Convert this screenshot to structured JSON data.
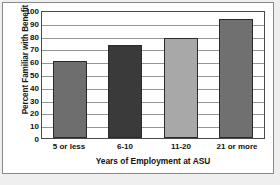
{
  "chart_data": {
    "type": "bar",
    "title": "",
    "categories": [
      "5 or less",
      "6-10",
      "11-20",
      "21 or more"
    ],
    "values": [
      60,
      73,
      78,
      93
    ],
    "xlabel": "Years of Employment at ASU",
    "ylabel": "Percent Familiar with Benefit",
    "ylim": [
      0,
      100
    ],
    "yticks": [
      100,
      90,
      80,
      70,
      60,
      50,
      40,
      30,
      20,
      10,
      0
    ],
    "grid": "horizontal",
    "legend": "none",
    "bar_colors": [
      "#6e6e6e",
      "#3a3a3a",
      "#a8a8a8",
      "#707070"
    ],
    "bar_edge_color": "#2b2b2b",
    "plot_background": "#ffffff",
    "gridline_color": "#949494",
    "axis_color": "#4a4a4a",
    "page_background": "#efefef",
    "text_color": "#111111"
  }
}
